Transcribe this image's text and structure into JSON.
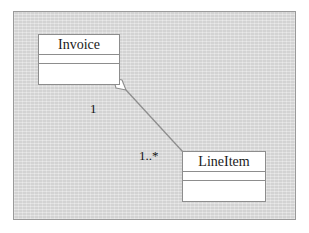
{
  "diagram": {
    "kind": "uml-class-diagram",
    "relationship": "aggregation",
    "canvas_background": "#d9d9d9",
    "canvas_border": "#9a9a9a",
    "class_fill": "#ffffff",
    "class_border": "#8d8d8d",
    "line_color": "#8e8e8e",
    "text_color": "#141414",
    "classes": [
      {
        "id": "invoice",
        "name": "Invoice",
        "compartments": [
          "",
          ""
        ]
      },
      {
        "id": "lineitem",
        "name": "LineItem",
        "compartments": [
          "",
          ""
        ]
      }
    ],
    "association": {
      "source": "Invoice",
      "target": "LineItem",
      "source_multiplicity": "1",
      "target_multiplicity": "1..*",
      "source_decoration": "hollow-diamond",
      "target_decoration": "none"
    }
  }
}
